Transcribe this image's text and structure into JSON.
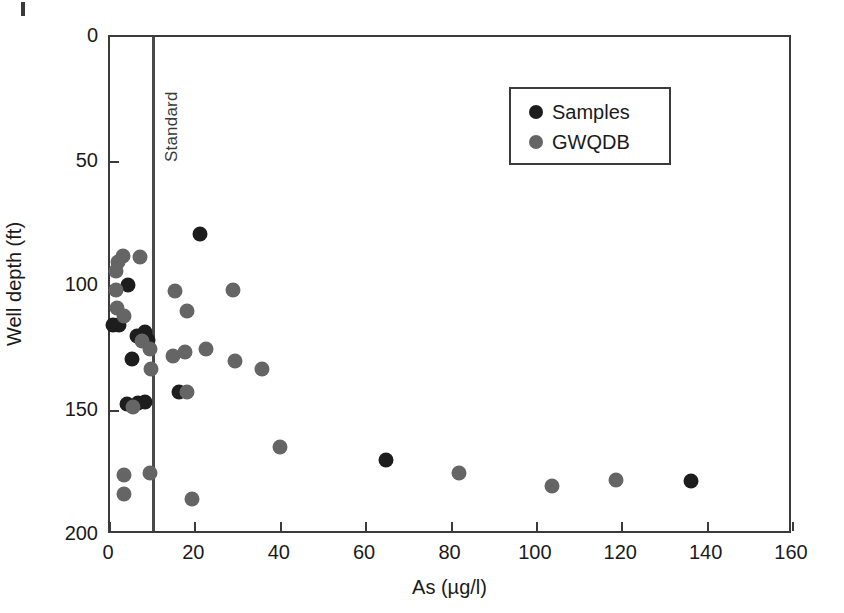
{
  "figure": {
    "background": "#ffffff",
    "page_mark": "scan-artifact"
  },
  "chart_data": {
    "type": "scatter",
    "title": "",
    "xlabel": "As (µg/l)",
    "ylabel": "Well depth (ft)",
    "xlim": [
      0,
      160
    ],
    "ylim": [
      0,
      200
    ],
    "y_inverted": true,
    "xticks": [
      0,
      20,
      40,
      60,
      80,
      100,
      120,
      140,
      160
    ],
    "xticklabels": [
      "0",
      "20",
      "40",
      "60",
      "80",
      "100",
      "120",
      "140",
      "160"
    ],
    "x_minor_ticks": [
      10
    ],
    "yticks": [
      0,
      50,
      100,
      150,
      200
    ],
    "yticklabels": [
      "0",
      "50",
      "100",
      "150",
      "200"
    ],
    "grid": false,
    "legend_position": "upper right",
    "annotations": [
      {
        "name": "standard-line",
        "text": "Standard",
        "type": "vline",
        "x": 10,
        "color": "#4a4a4a",
        "label_rotation": -90
      }
    ],
    "series": [
      {
        "name": "Samples",
        "color": "#1d1d1d",
        "marker": "circle",
        "points": [
          {
            "x": 21.0,
            "y": 79.0
          },
          {
            "x": 4.3,
            "y": 99.5
          },
          {
            "x": 0.7,
            "y": 115.5
          },
          {
            "x": 2.2,
            "y": 115.5
          },
          {
            "x": 6.4,
            "y": 120.0
          },
          {
            "x": 8.2,
            "y": 118.5
          },
          {
            "x": 9.0,
            "y": 121.5
          },
          {
            "x": 5.1,
            "y": 129.5
          },
          {
            "x": 3.9,
            "y": 147.5
          },
          {
            "x": 6.6,
            "y": 147.0
          },
          {
            "x": 8.3,
            "y": 146.5
          },
          {
            "x": 16.2,
            "y": 142.5
          },
          {
            "x": 64.7,
            "y": 170.0
          },
          {
            "x": 136.2,
            "y": 178.5
          }
        ]
      },
      {
        "name": "GWQDB",
        "color": "#656565",
        "marker": "circle",
        "points": [
          {
            "x": 1.8,
            "y": 90.5
          },
          {
            "x": 3.1,
            "y": 88.0
          },
          {
            "x": 7.1,
            "y": 88.5
          },
          {
            "x": 1.4,
            "y": 94.0
          },
          {
            "x": 1.5,
            "y": 101.5
          },
          {
            "x": 1.6,
            "y": 109.0
          },
          {
            "x": 3.3,
            "y": 112.0
          },
          {
            "x": 7.4,
            "y": 122.0
          },
          {
            "x": 9.3,
            "y": 125.5
          },
          {
            "x": 9.6,
            "y": 133.5
          },
          {
            "x": 5.5,
            "y": 148.5
          },
          {
            "x": 3.2,
            "y": 176.0
          },
          {
            "x": 3.3,
            "y": 183.5
          },
          {
            "x": 9.4,
            "y": 175.0
          },
          {
            "x": 15.2,
            "y": 102.0
          },
          {
            "x": 18.0,
            "y": 110.0
          },
          {
            "x": 14.7,
            "y": 128.0
          },
          {
            "x": 17.6,
            "y": 126.5
          },
          {
            "x": 18.0,
            "y": 142.5
          },
          {
            "x": 19.3,
            "y": 185.5
          },
          {
            "x": 22.5,
            "y": 125.5
          },
          {
            "x": 28.9,
            "y": 101.5
          },
          {
            "x": 29.3,
            "y": 130.0
          },
          {
            "x": 35.5,
            "y": 133.5
          },
          {
            "x": 39.8,
            "y": 164.5
          },
          {
            "x": 81.8,
            "y": 175.0
          },
          {
            "x": 103.5,
            "y": 180.5
          },
          {
            "x": 118.6,
            "y": 178.0
          }
        ]
      }
    ]
  },
  "legend": {
    "entries": [
      {
        "label": "Samples",
        "color": "#1d1d1d"
      },
      {
        "label": "GWQDB",
        "color": "#656565"
      }
    ]
  }
}
